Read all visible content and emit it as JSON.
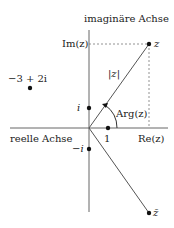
{
  "axes": {
    "imag_label": "imaginäre Achse",
    "real_label": "reelle Achse",
    "re_label": "Re(z)",
    "im_label": "Im(z)"
  },
  "points": {
    "z": "z",
    "z_conj": "z̄",
    "i": "i",
    "neg_i": "−i",
    "one": "1",
    "example": "−3 + 2i"
  },
  "annotations": {
    "modulus": "|z|",
    "argument": "Arg(z)"
  },
  "colors": {
    "line": "#555555",
    "dot": "#111111",
    "text": "#222222"
  }
}
